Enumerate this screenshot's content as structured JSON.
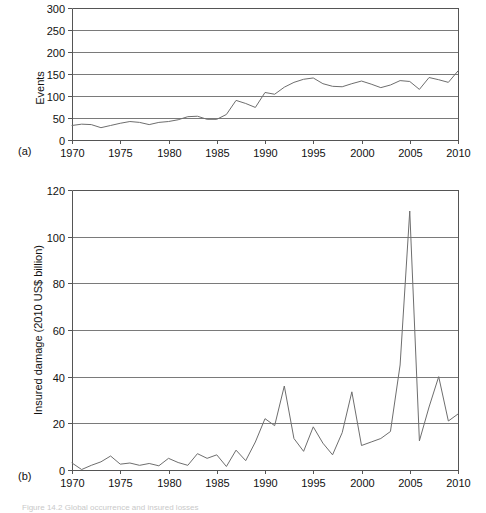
{
  "figure": {
    "panel_a_tag": "(a)",
    "panel_b_tag": "(b)",
    "caption": "Figure 14.2  Global occurrence and insured losses"
  },
  "chart_data": [
    {
      "id": "panel-a",
      "type": "line",
      "title": "",
      "xlabel": "",
      "ylabel": "Events",
      "xlim": [
        1970,
        2010
      ],
      "ylim": [
        0,
        300
      ],
      "xticks": [
        1970,
        1975,
        1980,
        1985,
        1990,
        1995,
        2000,
        2005,
        2010
      ],
      "yticks": [
        0,
        50,
        100,
        150,
        200,
        250,
        300
      ],
      "grid": true,
      "legend": "none",
      "series": [
        {
          "name": "Events",
          "x": [
            1970,
            1971,
            1972,
            1973,
            1974,
            1975,
            1976,
            1977,
            1978,
            1979,
            1980,
            1981,
            1982,
            1983,
            1984,
            1985,
            1986,
            1987,
            1988,
            1989,
            1990,
            1991,
            1992,
            1993,
            1994,
            1995,
            1996,
            1997,
            1998,
            1999,
            2000,
            2001,
            2002,
            2003,
            2004,
            2005,
            2006,
            2007,
            2008,
            2009,
            2010
          ],
          "values": [
            33,
            36,
            35,
            28,
            33,
            38,
            42,
            40,
            35,
            40,
            42,
            46,
            53,
            54,
            47,
            47,
            58,
            90,
            83,
            74,
            108,
            104,
            120,
            131,
            138,
            141,
            128,
            122,
            121,
            128,
            134,
            127,
            119,
            125,
            135,
            133,
            115,
            142,
            137,
            131,
            157
          ]
        }
      ]
    },
    {
      "id": "panel-b",
      "type": "line",
      "title": "",
      "xlabel": "",
      "ylabel": "Insured damage (2010 US$ billion)",
      "xlim": [
        1970,
        2010
      ],
      "ylim": [
        0,
        120
      ],
      "xticks": [
        1970,
        1975,
        1980,
        1985,
        1990,
        1995,
        2000,
        2005,
        2010
      ],
      "yticks": [
        0,
        20,
        40,
        60,
        80,
        100,
        120
      ],
      "grid": true,
      "legend": "none",
      "series": [
        {
          "name": "Insured damage",
          "x": [
            1970,
            1971,
            1972,
            1973,
            1974,
            1975,
            1976,
            1977,
            1978,
            1979,
            1980,
            1981,
            1982,
            1983,
            1984,
            1985,
            1986,
            1987,
            1988,
            1989,
            1990,
            1991,
            1992,
            1993,
            1994,
            1995,
            1996,
            1997,
            1998,
            1999,
            2000,
            2001,
            2002,
            2003,
            2004,
            2005,
            2006,
            2007,
            2008,
            2009,
            2010
          ],
          "values": [
            3.0,
            0.2,
            2.0,
            3.5,
            6.0,
            2.5,
            3.0,
            2.0,
            2.8,
            1.8,
            5.0,
            3.2,
            2.0,
            7.0,
            5.0,
            6.5,
            1.5,
            8.5,
            4.0,
            12.0,
            22.0,
            19.0,
            36.0,
            13.5,
            8.0,
            18.5,
            11.5,
            6.5,
            16.0,
            33.5,
            10.5,
            12.0,
            13.5,
            16.5,
            45.0,
            111.0,
            12.5,
            27.0,
            40.0,
            21.0,
            24.0
          ]
        }
      ]
    }
  ]
}
